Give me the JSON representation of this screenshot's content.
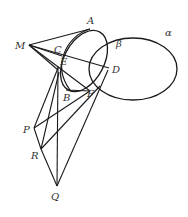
{
  "figure": {
    "curves": {
      "alpha": "α",
      "beta": "β"
    },
    "points": {
      "A": "A",
      "B": "B",
      "C": "C",
      "D": "D",
      "E": "E",
      "F": "F",
      "M": "M",
      "P": "P",
      "Q": "Q",
      "R": "R"
    }
  }
}
